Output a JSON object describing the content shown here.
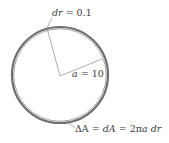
{
  "diagram": {
    "type": "annulus-area-element",
    "circle": {
      "cx": 60,
      "cy": 75,
      "r": 48,
      "stroke": "#6e6e6e",
      "inner_stroke": "#9a9a9a"
    },
    "radius_line_color": "#8a8a8a",
    "labels": {
      "dr": {
        "var": "dr",
        "eq": " = 0.1"
      },
      "a": {
        "var": "a",
        "eq": " = 10"
      },
      "area": {
        "delta": "ΔA",
        "eq1": " = ",
        "dA": "dA",
        "eq2": " = 2π",
        "a": "a",
        "space": " ",
        "dr": "dr"
      }
    }
  }
}
